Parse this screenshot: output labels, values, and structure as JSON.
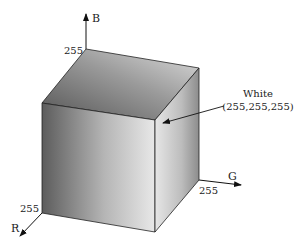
{
  "diagram": {
    "axes": {
      "b": {
        "name": "B",
        "max_label": "255"
      },
      "g": {
        "name": "G",
        "max_label": "255"
      },
      "r": {
        "name": "R",
        "max_label": "255"
      }
    },
    "annotation": {
      "name": "White",
      "value": "(255,255,255)"
    },
    "colors": {
      "stroke": "#1a1a1a",
      "top_dark": "#5a5a5a",
      "top_light": "#d8d8d8",
      "left_dark": "#5f5f5f",
      "left_light": "#e6e6e6",
      "right_dark": "#8a8a8a",
      "right_light": "#e0e0e0"
    }
  }
}
